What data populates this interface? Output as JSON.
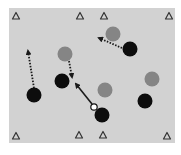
{
  "diagram": {
    "type": "sports-drill",
    "field_color": "#d2d2d2",
    "colors": {
      "attacker": "#0d0d0d",
      "defender": "#858585",
      "ball": "#ffffff",
      "cone": "#333333",
      "run_arrow": "#1a1a1a",
      "pass_arrow": "#1a1a1a"
    },
    "cones": [
      {
        "id": "cone-top-1"
      },
      {
        "id": "cone-top-2"
      },
      {
        "id": "cone-top-3"
      },
      {
        "id": "cone-top-4"
      },
      {
        "id": "cone-bottom-1"
      },
      {
        "id": "cone-bottom-2"
      },
      {
        "id": "cone-bottom-3"
      },
      {
        "id": "cone-bottom-4"
      }
    ],
    "defenders": [
      {
        "id": "defender-1"
      },
      {
        "id": "defender-2"
      },
      {
        "id": "defender-3"
      },
      {
        "id": "defender-4"
      }
    ],
    "attackers": [
      {
        "id": "attacker-1"
      },
      {
        "id": "attacker-2"
      },
      {
        "id": "attacker-3"
      },
      {
        "id": "attacker-4"
      },
      {
        "id": "attacker-5"
      }
    ],
    "ball": {
      "id": "ball",
      "possessed_by": "attacker-5"
    },
    "movements": [
      {
        "id": "run-1",
        "kind": "run",
        "style": "dotted",
        "from": "attacker-3",
        "to": "space-left"
      },
      {
        "id": "run-2",
        "kind": "run",
        "style": "dotted",
        "from": "defender-2",
        "to": "attacker-2"
      },
      {
        "id": "run-3",
        "kind": "run",
        "style": "dotted",
        "from": "attacker-1",
        "to": "defender-1"
      },
      {
        "id": "pass-1",
        "kind": "pass",
        "style": "solid",
        "from": "ball",
        "to": "attacker-2"
      }
    ]
  }
}
